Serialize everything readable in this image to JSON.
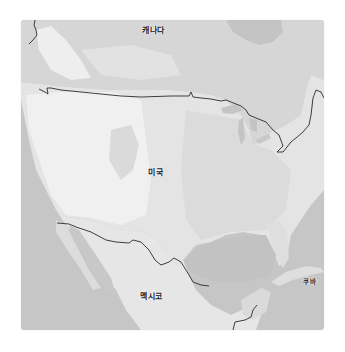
{
  "map": {
    "style": "grayscale-terrain",
    "colors": {
      "water": "#c6c6c6",
      "land_light": "#ececec",
      "land_mid": "#dcdcdc",
      "land_dark": "#d2d2d2",
      "border": "#2a2a2a",
      "label": "#222222"
    },
    "labels": {
      "canada": "캐나다",
      "usa": "미국",
      "mexico": "멕시코",
      "cuba": "쿠바"
    }
  }
}
